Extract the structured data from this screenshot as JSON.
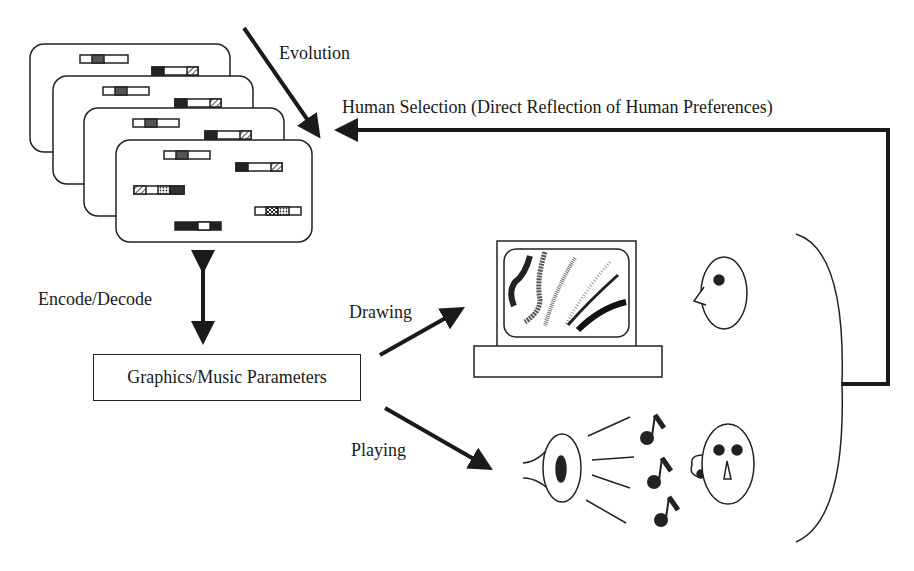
{
  "labels": {
    "evolution": "Evolution",
    "human_selection": "Human Selection (Direct Reflection of Human Preferences)",
    "encode_decode": "Encode/Decode",
    "parameters_box": "Graphics/Music Parameters",
    "drawing": "Drawing",
    "playing": "Playing"
  },
  "components": {
    "genome_cards": {
      "count": 4,
      "icon": "chromosome-card-stack"
    },
    "monitor": {
      "icon": "computer-monitor-icon"
    },
    "speaker": {
      "icon": "speaker-icon"
    },
    "music_notes": {
      "count": 3,
      "icon": "music-note-icon"
    },
    "faces": [
      {
        "icon": "face-profile-icon"
      },
      {
        "icon": "face-front-icon"
      }
    ],
    "human_bracket": {
      "icon": "bracket"
    }
  },
  "colors": {
    "ink": "#1a1a1a",
    "background": "#ffffff"
  }
}
